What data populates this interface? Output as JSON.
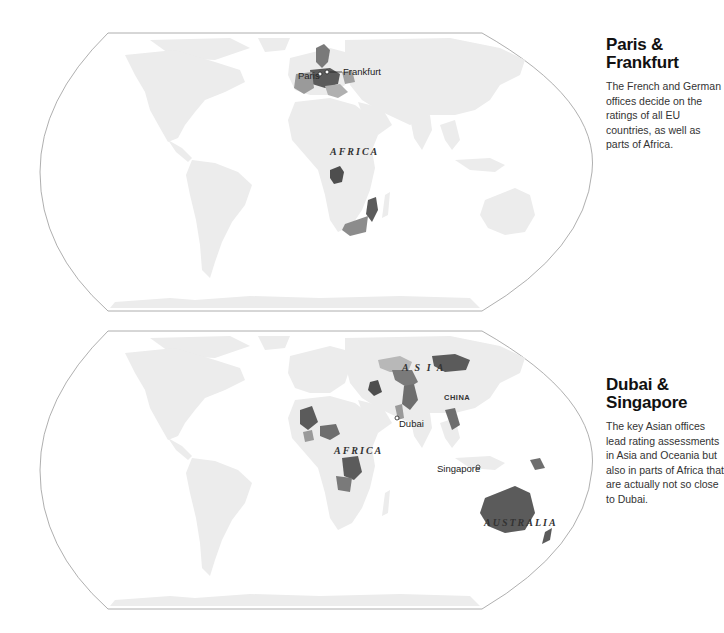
{
  "colors": {
    "land": "#ececec",
    "frame": "#9a9a9a",
    "dark_highlight": "#5b5b5b",
    "mid_highlight": "#8c8c8c",
    "light_highlight": "#b8b8b8",
    "background": "#ffffff"
  },
  "maps": [
    {
      "id": "paris-frankfurt",
      "title": "Paris & Frankfurt",
      "description": "The French and German offices decide on the ratings of all EU countries, as well as parts of Africa.",
      "region_labels": [
        "AFRICA"
      ],
      "cities": [
        {
          "name": "Paris"
        },
        {
          "name": "Frankfurt"
        }
      ]
    },
    {
      "id": "dubai-singapore",
      "title": "Dubai & Singapore",
      "description": "The key Asian offices lead rating assessments in Asia and Oceania but also in parts of Africa that are actually not so close to Dubai.",
      "region_labels": [
        "A S I A",
        "AFRICA",
        "AUSTRALIA"
      ],
      "country_labels": [
        "CHINA"
      ],
      "cities": [
        {
          "name": "Dubai"
        },
        {
          "name": "Singapore"
        }
      ]
    }
  ]
}
